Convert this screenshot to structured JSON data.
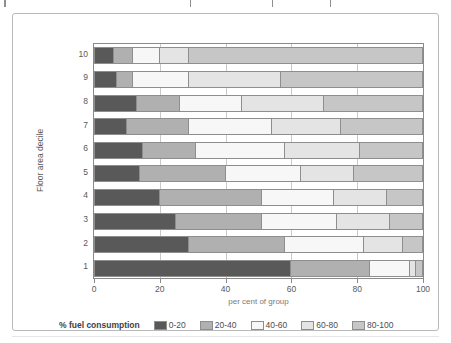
{
  "top_caption": {
    "visible_fragments": [
      "",
      "",
      "",
      ""
    ]
  },
  "chart_data": {
    "type": "bar",
    "orientation": "horizontal",
    "stacked": true,
    "stack_mode": "percent",
    "title": "",
    "subtitle": "",
    "xlabel": "per cent of group",
    "ylabel": "Floor area decile",
    "xlim": [
      0,
      100
    ],
    "xticks": [
      0,
      20,
      40,
      60,
      80,
      100
    ],
    "xtick_labels": [
      "0",
      "20",
      "40",
      "60",
      "80",
      "100"
    ],
    "grid": true,
    "grid_axis": "x",
    "legend_title": "% fuel consumption",
    "legend_position": "bottom",
    "categories": [
      "1",
      "2",
      "3",
      "4",
      "5",
      "6",
      "7",
      "8",
      "9",
      "10"
    ],
    "category_order_top_to_bottom": [
      "10",
      "9",
      "8",
      "7",
      "6",
      "5",
      "4",
      "3",
      "2",
      "1"
    ],
    "series": [
      {
        "name": "0-20",
        "color": "#595959",
        "values": [
          60,
          29,
          25,
          20,
          14,
          15,
          10,
          13,
          7,
          6
        ]
      },
      {
        "name": "20-40",
        "color": "#b0b0b0",
        "values": [
          24,
          29,
          26,
          31,
          26,
          16,
          19,
          13,
          5,
          6
        ]
      },
      {
        "name": "40-60",
        "color": "#f7f7f7",
        "values": [
          12,
          24,
          23,
          22,
          23,
          27,
          25,
          19,
          17,
          8
        ]
      },
      {
        "name": "60-80",
        "color": "#e4e4e4",
        "values": [
          2,
          12,
          16,
          16,
          16,
          23,
          21,
          25,
          28,
          9
        ]
      },
      {
        "name": "80-100",
        "color": "#c6c6c6",
        "values": [
          2,
          6,
          10,
          11,
          21,
          19,
          25,
          30,
          43,
          71
        ]
      }
    ],
    "colors": {
      "series_0_20": "#595959",
      "series_20_40": "#b0b0b0",
      "series_40_60": "#f7f7f7",
      "series_60_80": "#e4e4e4",
      "series_80_100": "#c6c6c6",
      "axis": "#8a8a8a",
      "grid": "#c9c9c9",
      "frame": "#b9b9b9",
      "text": "#595959"
    }
  }
}
